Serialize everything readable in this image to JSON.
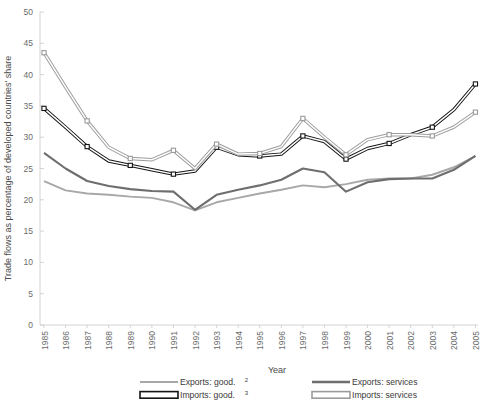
{
  "chart_data": {
    "type": "line",
    "title": "",
    "xlabel": "Year",
    "ylabel": "Trade flows as percentage of developed countries' share",
    "ylim": [
      0,
      50
    ],
    "ytick_step": 5,
    "grid": true,
    "legend_position": "bottom",
    "categories": [
      "1985",
      "1986",
      "1987",
      "1988",
      "1989",
      "1990",
      "1991",
      "1992",
      "1993",
      "1994",
      "1995",
      "1996",
      "1997",
      "1998",
      "1999",
      "2000",
      "2001",
      "2002",
      "2003",
      "2004",
      "2005"
    ],
    "yticks": [
      "0",
      "5",
      "10",
      "15",
      "20",
      "25",
      "30",
      "35",
      "40",
      "45",
      "50"
    ],
    "series": [
      {
        "name": "Exports: good.",
        "footnote": "2",
        "color": "#a8a8a8",
        "style": "solid-thin",
        "values": [
          23.0,
          21.5,
          21.0,
          20.8,
          20.5,
          20.3,
          19.6,
          18.3,
          19.6,
          20.3,
          21.0,
          21.6,
          22.3,
          22.0,
          22.5,
          23.2,
          23.4,
          23.4,
          24.0,
          25.2,
          27.0
        ]
      },
      {
        "name": "Exports: services",
        "footnote": "",
        "color": "#6e6e6e",
        "style": "solid-thick",
        "values": [
          27.5,
          25.0,
          23.0,
          22.2,
          21.7,
          21.4,
          21.3,
          18.4,
          20.8,
          21.6,
          22.3,
          23.2,
          25.0,
          24.4,
          21.3,
          22.8,
          23.3,
          23.4,
          23.4,
          24.8,
          27.0
        ]
      },
      {
        "name": "Imports: good.",
        "footnote": "3",
        "color": "#151515",
        "style": "outline-black",
        "values": [
          34.6,
          31.6,
          28.5,
          26.2,
          25.5,
          24.8,
          24.1,
          24.6,
          28.4,
          27.2,
          27.0,
          27.3,
          30.2,
          29.3,
          26.5,
          28.2,
          29.0,
          30.4,
          31.6,
          34.4,
          38.5
        ]
      },
      {
        "name": "Imports: services",
        "footnote": "",
        "color": "#9b9b9b",
        "style": "outline-gray",
        "values": [
          43.5,
          38.0,
          32.6,
          28.4,
          26.6,
          26.4,
          27.9,
          25.0,
          28.9,
          27.3,
          27.4,
          28.5,
          33.0,
          30.0,
          27.2,
          29.6,
          30.4,
          30.4,
          30.2,
          31.6,
          34.0
        ]
      }
    ]
  },
  "legend": {
    "items": [
      {
        "label": "Exports: good.",
        "sup": "2",
        "swatch": "line-gray-thin"
      },
      {
        "label": "Exports: services",
        "sup": "",
        "swatch": "line-gray-thick"
      },
      {
        "label": "Imports: good.",
        "sup": "3",
        "swatch": "bar-outline-black"
      },
      {
        "label": "Imports: services",
        "sup": "",
        "swatch": "bar-outline-gray"
      }
    ]
  }
}
